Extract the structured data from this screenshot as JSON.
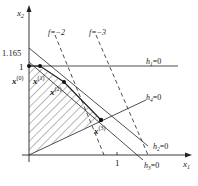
{
  "axes": {
    "x_label": "x",
    "x_sub": "1",
    "y_label": "x",
    "y_sub": "2",
    "x_tick_1": "1",
    "y_tick_1": "1",
    "y_tick_1165": "1.165"
  },
  "lines": {
    "h1": {
      "name": "h",
      "sub": "1",
      "eq": "=0"
    },
    "h2": {
      "name": "h",
      "sub": "2",
      "eq": "=0"
    },
    "h3": {
      "name": "h",
      "sub": "3",
      "eq": "=0"
    },
    "h4": {
      "name": "h",
      "sub": "4",
      "eq": "=0"
    },
    "f2": {
      "label": "f=−2"
    },
    "f3": {
      "label": "f=−3"
    }
  },
  "points": {
    "x0": {
      "name": "x",
      "sup": "(0)"
    },
    "x1": {
      "name": "x",
      "sup": "(1)"
    },
    "x2": {
      "name": "x",
      "sup": "(2)"
    },
    "x3": {
      "name": "x",
      "sup": "(3)"
    }
  },
  "colors": {
    "ink": "#222222",
    "background": "#ffffff"
  }
}
